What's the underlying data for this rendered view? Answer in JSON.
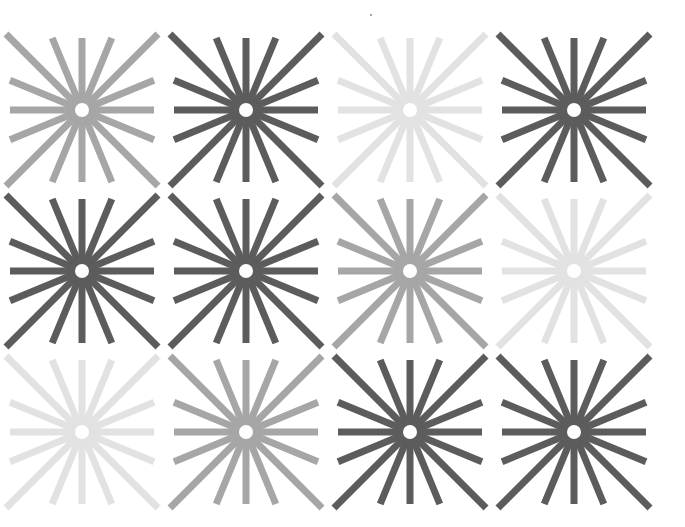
{
  "canvas": {
    "width": 685,
    "height": 527,
    "background": "#ffffff"
  },
  "palette": {
    "dark": "#5c5c5c",
    "mid": "#a6a6a6",
    "light": "#e2e2e2"
  },
  "starburst": {
    "ray_count": 16,
    "ray_width": 7,
    "hub_radius": 14,
    "hole_radius": 7,
    "axis_ray_length": 72,
    "diagonal_ray_reach": 76
  },
  "grid": {
    "columns_x": [
      82,
      246,
      410,
      574
    ],
    "rows_y": [
      110,
      271,
      432
    ],
    "cells": [
      {
        "row": 0,
        "col": 0,
        "shade": "mid"
      },
      {
        "row": 0,
        "col": 1,
        "shade": "dark"
      },
      {
        "row": 0,
        "col": 2,
        "shade": "light"
      },
      {
        "row": 0,
        "col": 3,
        "shade": "dark"
      },
      {
        "row": 1,
        "col": 0,
        "shade": "dark"
      },
      {
        "row": 1,
        "col": 1,
        "shade": "dark"
      },
      {
        "row": 1,
        "col": 2,
        "shade": "mid"
      },
      {
        "row": 1,
        "col": 3,
        "shade": "light"
      },
      {
        "row": 2,
        "col": 0,
        "shade": "light"
      },
      {
        "row": 2,
        "col": 1,
        "shade": "mid"
      },
      {
        "row": 2,
        "col": 2,
        "shade": "dark"
      },
      {
        "row": 2,
        "col": 3,
        "shade": "dark"
      }
    ]
  }
}
